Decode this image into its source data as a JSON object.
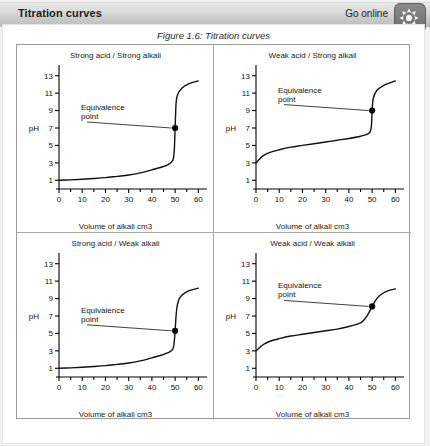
{
  "header": {
    "title": "Titration curves",
    "go_online_label": "Go online",
    "online_icon": "asterisk-starburst-icon"
  },
  "figure": {
    "caption": "Figure 1.6: Titration curves"
  },
  "axis": {
    "y_label": "pH",
    "x_label": "Volume of alkali cm3",
    "y_ticks": [
      1,
      3,
      5,
      7,
      9,
      11,
      13
    ],
    "x_ticks": [
      0,
      10,
      20,
      30,
      40,
      50,
      60
    ],
    "x_minor_step": 5,
    "annotation_line1": "Equivalence",
    "annotation_line2": "point"
  },
  "chart_data": [
    {
      "type": "line",
      "title": "Strong acid / Strong alkali",
      "xlabel": "Volume of alkali cm3",
      "ylabel": "pH",
      "xlim": [
        0,
        62
      ],
      "ylim": [
        0,
        14
      ],
      "grid": false,
      "legend": "none",
      "annotations": [
        {
          "text": "Equivalence point",
          "x": 50,
          "y": 7,
          "marker": "filled-circle"
        }
      ],
      "x": [
        0,
        5,
        10,
        15,
        20,
        25,
        30,
        35,
        40,
        44,
        47,
        49,
        49.6,
        50,
        50.4,
        51,
        53,
        56,
        60
      ],
      "y": [
        1.0,
        1.05,
        1.12,
        1.2,
        1.3,
        1.45,
        1.6,
        1.85,
        2.2,
        2.5,
        2.8,
        3.3,
        4.3,
        7.0,
        9.8,
        10.8,
        11.6,
        12.1,
        12.4
      ]
    },
    {
      "type": "line",
      "title": "Weak acid / Strong alkali",
      "xlabel": "Volume of alkali cm3",
      "ylabel": "pH",
      "xlim": [
        0,
        62
      ],
      "ylim": [
        0,
        14
      ],
      "grid": false,
      "legend": "none",
      "annotations": [
        {
          "text": "Equivalence point",
          "x": 50,
          "y": 9,
          "marker": "filled-circle"
        }
      ],
      "x": [
        0,
        3,
        6,
        10,
        15,
        20,
        25,
        30,
        35,
        40,
        44,
        47,
        49,
        49.7,
        50,
        50.5,
        52,
        55,
        58,
        60
      ],
      "y": [
        3.0,
        3.8,
        4.2,
        4.5,
        4.8,
        5.0,
        5.2,
        5.4,
        5.6,
        5.8,
        6.0,
        6.2,
        6.5,
        7.3,
        9.0,
        10.4,
        11.3,
        11.9,
        12.2,
        12.4
      ]
    },
    {
      "type": "line",
      "title": "Strong acid / Weak alkali",
      "xlabel": "Volume of alkali cm3",
      "ylabel": "pH",
      "xlim": [
        0,
        62
      ],
      "ylim": [
        0,
        14
      ],
      "grid": false,
      "legend": "none",
      "annotations": [
        {
          "text": "Equivalence point",
          "x": 50,
          "y": 5.3,
          "marker": "filled-circle"
        }
      ],
      "x": [
        0,
        5,
        10,
        15,
        20,
        25,
        30,
        35,
        40,
        44,
        47,
        49,
        49.6,
        50,
        50.6,
        51.5,
        53,
        56,
        60
      ],
      "y": [
        1.0,
        1.05,
        1.12,
        1.2,
        1.3,
        1.45,
        1.6,
        1.85,
        2.2,
        2.5,
        2.8,
        3.2,
        4.0,
        5.3,
        7.6,
        8.8,
        9.4,
        9.9,
        10.2
      ]
    },
    {
      "type": "line",
      "title": "Weak acid / Weak alkali",
      "xlabel": "Volume of alkali cm3",
      "ylabel": "pH",
      "xlim": [
        0,
        62
      ],
      "ylim": [
        0,
        14
      ],
      "grid": false,
      "legend": "none",
      "annotations": [
        {
          "text": "Equivalence point",
          "x": 50,
          "y": 8.1,
          "marker": "filled-circle"
        }
      ],
      "x": [
        0,
        3,
        6,
        10,
        15,
        20,
        25,
        30,
        35,
        40,
        44,
        46,
        48,
        50,
        52,
        54,
        56,
        58,
        60
      ],
      "y": [
        3.0,
        3.7,
        4.1,
        4.4,
        4.7,
        4.9,
        5.1,
        5.3,
        5.5,
        5.8,
        6.1,
        6.4,
        7.1,
        8.1,
        9.0,
        9.5,
        9.8,
        10.0,
        10.1
      ]
    }
  ]
}
